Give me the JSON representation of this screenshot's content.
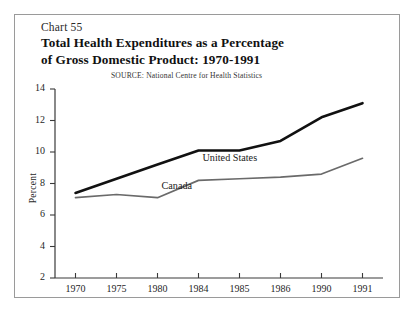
{
  "figure": {
    "chart_number": "Chart 55",
    "title_line1": "Total Health Expenditures as a Percentage",
    "title_line2": "of Gross Domestic Product:  1970-1991",
    "source": "SOURCE:  National Centre for Health Statistics"
  },
  "chart_data": {
    "type": "line",
    "title": "Total Health Expenditures as a Percentage of Gross Domestic Product: 1970-1991",
    "subtitle": "Chart 55",
    "note": "SOURCE:  National Centre for Health Statistics",
    "xlabel": "",
    "ylabel": "Percent",
    "categories": [
      "1970",
      "1975",
      "1980",
      "1984",
      "1985",
      "1986",
      "1990",
      "1991"
    ],
    "ylim": [
      2,
      14
    ],
    "yticks": [
      2,
      4,
      6,
      8,
      10,
      12,
      14
    ],
    "grid": false,
    "legend": "inline-labels",
    "series": [
      {
        "name": "United States",
        "color": "#111111",
        "width": 2.6,
        "values": [
          7.4,
          8.3,
          9.2,
          10.1,
          10.1,
          10.7,
          12.2,
          13.1
        ]
      },
      {
        "name": "Canada",
        "color": "#6a6a6a",
        "width": 1.7,
        "values": [
          7.1,
          7.3,
          7.1,
          8.2,
          8.3,
          8.4,
          8.6,
          9.6
        ]
      }
    ],
    "annotations": [
      {
        "text": "United States",
        "x": "1984",
        "y": 9.55
      },
      {
        "text": "Canada",
        "x": "1980",
        "y": 7.75
      }
    ]
  }
}
